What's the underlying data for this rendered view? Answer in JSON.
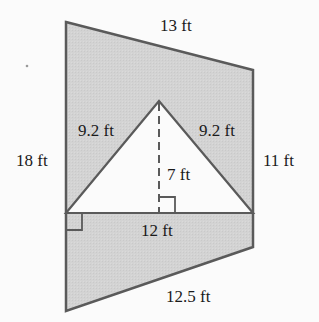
{
  "figure": {
    "type": "composite-area-diagram",
    "colors": {
      "fill": "#d2d2d2",
      "stroke": "#5a5a5a",
      "triangle_fill": "#fbfbfb",
      "text": "#1a1a1a"
    },
    "labels": {
      "top_side": "13 ft",
      "left_side": "18 ft",
      "right_side": "11 ft",
      "bottom_side": "12.5 ft",
      "triangle_left": "9.2 ft",
      "triangle_right": "9.2 ft",
      "triangle_height": "7 ft",
      "triangle_base": "12 ft"
    }
  }
}
